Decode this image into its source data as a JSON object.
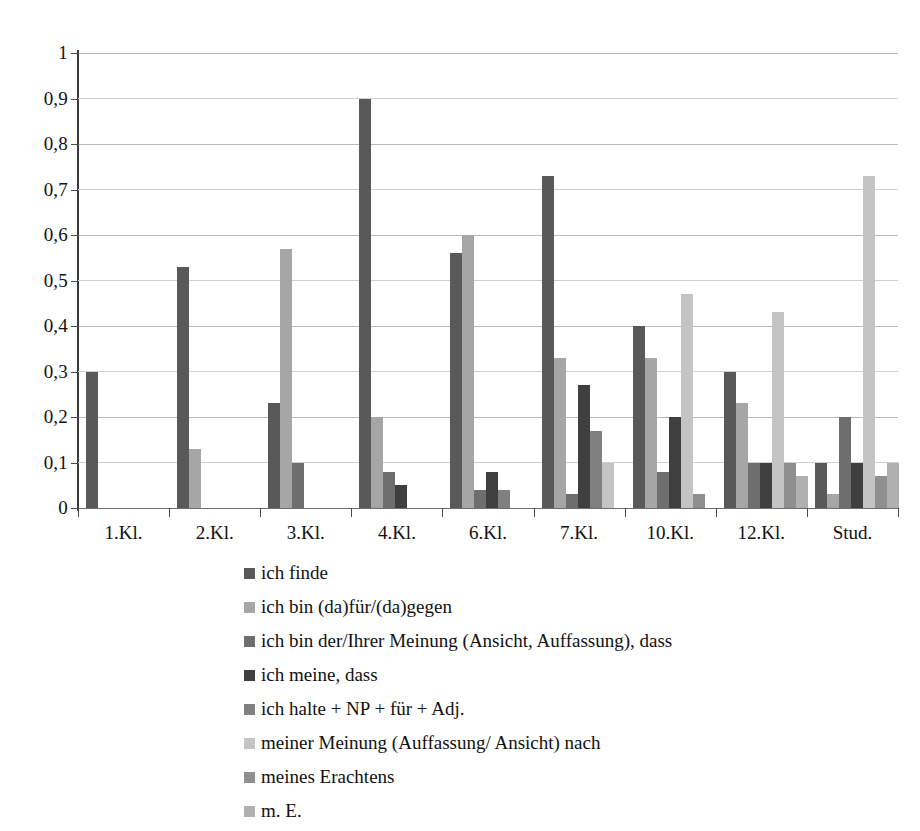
{
  "chart_data": {
    "type": "bar",
    "title": "",
    "subtitle": "",
    "xlabel": "",
    "ylabel": "",
    "ylim": [
      0,
      1
    ],
    "ytick_labels": [
      "0",
      "0,1",
      "0,2",
      "0,3",
      "0,4",
      "0,5",
      "0,6",
      "0,7",
      "0,8",
      "0,9",
      "1"
    ],
    "ytick_values": [
      0,
      0.1,
      0.2,
      0.3,
      0.4,
      0.5,
      0.6,
      0.7,
      0.8,
      0.9,
      1
    ],
    "grid": true,
    "grid_axis": "y",
    "legend_position": "bottom",
    "categories": [
      "1.Kl.",
      "2.Kl.",
      "3.Kl.",
      "4.Kl.",
      "6.Kl.",
      "7.Kl.",
      "10.Kl.",
      "12.Kl.",
      "Stud."
    ],
    "series": [
      {
        "name": "ich finde",
        "color": "#595959",
        "values": [
          0.3,
          0.53,
          0.23,
          0.9,
          0.56,
          0.73,
          0.4,
          0.3,
          0.1
        ]
      },
      {
        "name": "ich bin (da)für/(da)gegen",
        "color": "#a6a6a6",
        "values": [
          0,
          0.13,
          0.57,
          0.2,
          0.6,
          0.33,
          0.33,
          0.23,
          0.03
        ]
      },
      {
        "name": "ich bin der/Ihrer Meinung (Ansicht, Auffassung), dass",
        "color": "#6e6e6e",
        "values": [
          0,
          0,
          0.1,
          0.08,
          0.04,
          0.03,
          0.08,
          0.1,
          0.2
        ]
      },
      {
        "name": "ich meine, dass",
        "color": "#3f3f3f",
        "values": [
          0,
          0,
          0,
          0.05,
          0.08,
          0.27,
          0.2,
          0.1,
          0.1
        ]
      },
      {
        "name": "ich halte + NP + für + Adj.",
        "color": "#808080",
        "values": [
          0,
          0,
          0,
          0,
          0.04,
          0.17,
          0.0,
          0.0,
          0.0
        ]
      },
      {
        "name": "meiner Meinung (Auffassung/ Ansicht) nach",
        "color": "#c4c4c4",
        "values": [
          0,
          0,
          0,
          0,
          0,
          0.1,
          0.47,
          0.43,
          0.73
        ]
      },
      {
        "name": "meines Erachtens",
        "color": "#8f8f8f",
        "values": [
          0,
          0,
          0,
          0,
          0,
          0,
          0.03,
          0.1,
          0.07
        ]
      },
      {
        "name": "m. E.",
        "color": "#b0b0b0",
        "values": [
          0,
          0,
          0,
          0,
          0,
          0,
          0,
          0.07,
          0.1
        ]
      }
    ]
  }
}
